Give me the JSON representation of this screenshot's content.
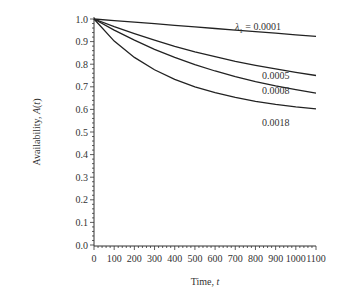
{
  "chart_data": {
    "type": "line",
    "title": "",
    "xlabel": "Time, t",
    "ylabel": "Availability, A(t)",
    "xlim": [
      0,
      1100
    ],
    "ylim": [
      0.0,
      1.0
    ],
    "x_ticks": [
      "0",
      "100",
      "200",
      "300",
      "400",
      "500",
      "600",
      "700",
      "800",
      "900",
      "1000",
      "1100"
    ],
    "y_ticks": [
      "0.0",
      "0.1",
      "0.2",
      "0.3",
      "0.4",
      "0.5",
      "0.6",
      "0.7",
      "0.8",
      "0.9",
      "1.0"
    ],
    "grid": false,
    "legend": "inline labels",
    "x": [
      0,
      100,
      200,
      300,
      400,
      500,
      600,
      700,
      800,
      900,
      1000,
      1100
    ],
    "series": [
      {
        "name": "λ1 = 0.0001",
        "label": "λ1 = 0.0001",
        "values": [
          1.0,
          0.993,
          0.986,
          0.979,
          0.972,
          0.965,
          0.958,
          0.951,
          0.944,
          0.937,
          0.93,
          0.923
        ]
      },
      {
        "name": "0.0005",
        "label": "0.0005",
        "values": [
          1.0,
          0.966,
          0.935,
          0.906,
          0.879,
          0.855,
          0.833,
          0.813,
          0.795,
          0.779,
          0.764,
          0.75
        ]
      },
      {
        "name": "0.0008",
        "label": "0.0008",
        "values": [
          1.0,
          0.951,
          0.906,
          0.866,
          0.83,
          0.798,
          0.77,
          0.745,
          0.723,
          0.704,
          0.687,
          0.672
        ]
      },
      {
        "name": "0.0018",
        "label": "0.0018",
        "values": [
          1.0,
          0.902,
          0.83,
          0.775,
          0.733,
          0.7,
          0.674,
          0.653,
          0.636,
          0.622,
          0.611,
          0.602
        ]
      }
    ]
  }
}
